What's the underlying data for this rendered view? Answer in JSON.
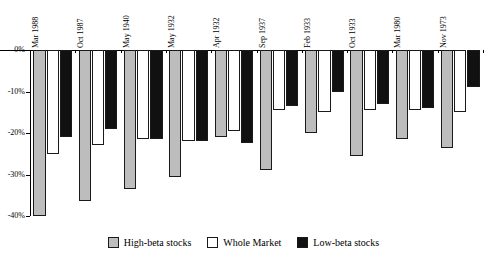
{
  "chart_data": {
    "type": "bar",
    "title": "",
    "subtitle": "",
    "xlabel": "",
    "ylabel": "",
    "orientation": "vertical",
    "grid": false,
    "legend_position": "bottom",
    "ylim": [
      -40,
      0
    ],
    "ytick_labels": [
      "0%",
      "-10%",
      "-20%",
      "-30%",
      "-40%"
    ],
    "ytick_values": [
      0,
      -10,
      -20,
      -30,
      -40
    ],
    "categories": [
      "Mar 1988",
      "Oct 1987",
      "May 1940",
      "May 1932",
      "Apr 1932",
      "Sep 1937",
      "Feb 1933",
      "Oct 1933",
      "Mar 1980",
      "Nov 1973"
    ],
    "series": [
      {
        "name": "High-beta stocks",
        "color": "#bdbdbd",
        "values": [
          -40.0,
          -36.5,
          -33.5,
          -30.5,
          -21.0,
          -29.0,
          -20.0,
          -25.5,
          -21.5,
          -23.5
        ]
      },
      {
        "name": "Whole Market",
        "color": "#ffffff",
        "values": [
          -25.0,
          -23.0,
          -21.5,
          -22.0,
          -19.5,
          -14.5,
          -15.0,
          -14.5,
          -14.5,
          -15.0
        ]
      },
      {
        "name": "Low-beta stocks",
        "color": "#111111",
        "values": [
          -21.0,
          -19.0,
          -21.5,
          -22.0,
          -22.5,
          -13.5,
          -10.0,
          -13.0,
          -14.0,
          -9.0
        ]
      }
    ]
  },
  "legend": {
    "items": [
      {
        "label": "High-beta stocks",
        "color": "#bdbdbd"
      },
      {
        "label": "Whole Market",
        "color": "#ffffff"
      },
      {
        "label": "Low-beta stocks",
        "color": "#111111"
      }
    ]
  }
}
